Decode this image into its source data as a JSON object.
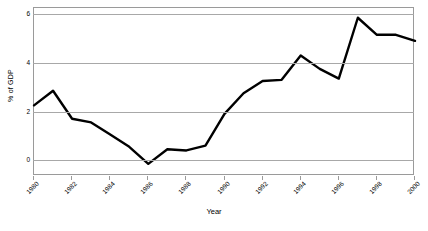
{
  "chart_data": {
    "type": "line",
    "title": "",
    "xlabel": "Year",
    "ylabel": "% of GDP",
    "xlim": [
      1980,
      2000
    ],
    "ylim": [
      -0.6,
      6.3
    ],
    "grid": true,
    "legend": "none",
    "line_color": "#000000",
    "grid_color": "#a8a8a8",
    "frame_color": "#9a9a9a",
    "y_ticks": [
      0,
      2,
      4,
      6
    ],
    "y_tick_labels": [
      "0",
      "2",
      "4",
      "6"
    ],
    "x_ticks": [
      1980,
      1982,
      1984,
      1986,
      1988,
      1990,
      1992,
      1994,
      1996,
      1998,
      2000
    ],
    "x_tick_labels": [
      "1980",
      "1982",
      "1984",
      "1986",
      "1988",
      "1990",
      "1992",
      "1994",
      "1996",
      "1998",
      "2000"
    ],
    "x": [
      1980,
      1981,
      1982,
      1983,
      1984,
      1985,
      1986,
      1987,
      1988,
      1989,
      1990,
      1991,
      1992,
      1993,
      1994,
      1995,
      1996,
      1997,
      1998,
      1999,
      2000
    ],
    "values": [
      2.3,
      2.9,
      1.75,
      1.6,
      1.1,
      0.6,
      -0.1,
      0.5,
      0.45,
      0.65,
      1.95,
      2.8,
      3.3,
      3.35,
      4.35,
      3.8,
      3.4,
      5.9,
      5.2,
      5.2,
      4.95
    ],
    "series": [
      {
        "name": "% of GDP",
        "values": [
          2.3,
          2.9,
          1.75,
          1.6,
          1.1,
          0.6,
          -0.1,
          0.5,
          0.45,
          0.65,
          1.95,
          2.8,
          3.3,
          3.35,
          4.35,
          3.8,
          3.4,
          5.9,
          5.2,
          5.2,
          4.95
        ]
      }
    ]
  }
}
